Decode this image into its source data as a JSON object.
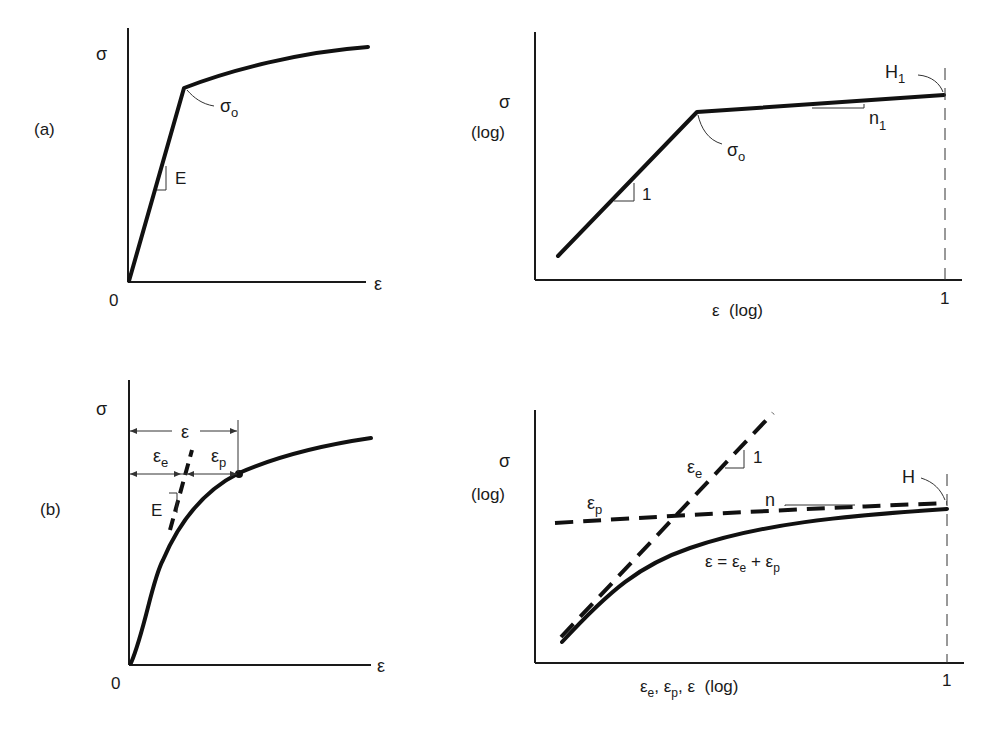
{
  "panels": {
    "a_left": {
      "row_label": "(a)",
      "y_label": "σ",
      "x_label": "ε",
      "origin_label": "0",
      "slope_label": "E",
      "yield_label": "σ",
      "yield_sub": "o"
    },
    "a_right": {
      "y_label": "σ",
      "y_label_2": "(log)",
      "x_label": "ε  (log)",
      "x_tick": "1",
      "slope_label": "1",
      "yield_label": "σ",
      "yield_sub": "o",
      "n_label": "n",
      "n_sub": "1",
      "h_label": "H",
      "h_sub": "1"
    },
    "b_left": {
      "row_label": "(b)",
      "y_label": "σ",
      "x_label": "ε",
      "origin_label": "0",
      "slope_label": "E",
      "total_strain_label": "ε",
      "elastic_label": "ε",
      "elastic_sub": "e",
      "plastic_label": "ε",
      "plastic_sub": "p"
    },
    "b_right": {
      "y_label": "σ",
      "y_label_2": "(log)",
      "x_label": "ε",
      "x_label_e": "e",
      "x_label_mid": ", ε",
      "x_label_p": "p",
      "x_label_end": ", ε  (log)",
      "x_tick": "1",
      "elastic_label": "ε",
      "elastic_sub": "e",
      "elastic_slope": "1",
      "plastic_label": "ε",
      "plastic_sub": "p",
      "n_label": "n",
      "h_label": "H",
      "sum_label": "ε = ε",
      "sum_sub_e": "e",
      "sum_plus": " + ε",
      "sum_sub_p": "p"
    }
  }
}
